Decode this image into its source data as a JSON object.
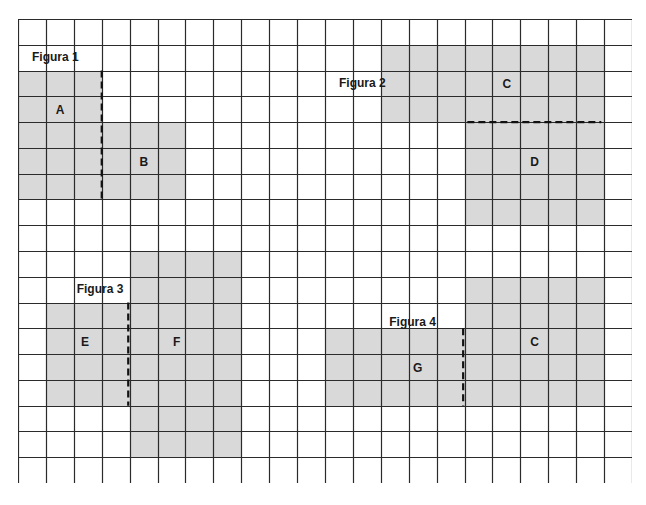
{
  "grid": {
    "cols": 22,
    "rows": 18,
    "cell_width": 27.91,
    "cell_height": 25.78,
    "line_color": "#2b2b2b",
    "shade_color": "#d9d9d9"
  },
  "figures": [
    {
      "title": "Figura 1",
      "title_cell": [
        0,
        1
      ],
      "regions": [
        {
          "label": "A",
          "col": 0,
          "row": 2,
          "cols": 3,
          "rows": 5,
          "label_pos": [
            1.5,
            3.3
          ]
        },
        {
          "label": "B",
          "col": 3,
          "row": 4,
          "cols": 3,
          "rows": 3,
          "label_pos": [
            4.5,
            5.3
          ]
        }
      ],
      "cut": {
        "orientation": "vertical",
        "at": 3,
        "from": 2,
        "to": 7
      }
    },
    {
      "title": "Figura 2",
      "title_cell": [
        11,
        2
      ],
      "regions": [
        {
          "label": "C",
          "col": 13,
          "row": 1,
          "cols": 8,
          "rows": 3,
          "label_pos": [
            17.5,
            2.3
          ]
        },
        {
          "label": "D",
          "col": 16,
          "row": 4,
          "cols": 5,
          "rows": 4,
          "label_pos": [
            18.5,
            5.3
          ]
        }
      ],
      "cut": {
        "orientation": "horizontal",
        "at": 4,
        "from": 16.1,
        "to": 20.9
      }
    },
    {
      "title": "Figura 3",
      "title_cell": [
        1.6,
        10
      ],
      "regions": [
        {
          "label": "E",
          "col": 1,
          "row": 11,
          "cols": 3,
          "rows": 4,
          "label_pos": [
            2.4,
            12.3
          ]
        },
        {
          "label": "F",
          "col": 4,
          "row": 9,
          "cols": 4,
          "rows": 8,
          "label_pos": [
            5.7,
            12.3
          ]
        }
      ],
      "cut": {
        "orientation": "vertical",
        "at": 3.95,
        "from": 11,
        "to": 15
      }
    },
    {
      "title": "Figura 4",
      "title_cell": [
        12.8,
        11.3
      ],
      "regions": [
        {
          "label": "G",
          "col": 11,
          "row": 12,
          "cols": 5,
          "rows": 3,
          "label_pos": [
            14.3,
            13.3
          ]
        },
        {
          "label": "C",
          "col": 16,
          "row": 10,
          "cols": 5,
          "rows": 5,
          "label_pos": [
            18.5,
            12.3
          ]
        }
      ],
      "cut": {
        "orientation": "vertical",
        "at": 15.95,
        "from": 12,
        "to": 15
      }
    }
  ]
}
